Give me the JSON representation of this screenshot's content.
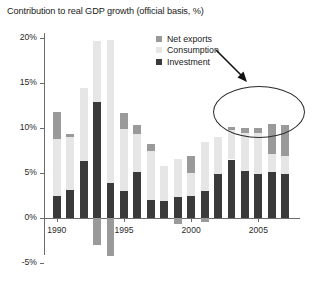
{
  "chart_data": {
    "type": "bar",
    "stacked": true,
    "title": "Contribution to real GDP growth (official basis, %)",
    "xlabel": "",
    "ylabel": "",
    "ylim": [
      -5,
      20
    ],
    "yticks": [
      "-5%",
      "0%",
      "5%",
      "10%",
      "15%",
      "20%"
    ],
    "ytick_values": [
      -5,
      0,
      5,
      10,
      15,
      20
    ],
    "xtick_labels": [
      "1990",
      "1995",
      "2000",
      "2005"
    ],
    "xtick_years": [
      1990,
      1995,
      2000,
      2005
    ],
    "grid": false,
    "legend_position": "top-center",
    "categories": [
      1990,
      1991,
      1992,
      1993,
      1994,
      1995,
      1996,
      1997,
      1998,
      1999,
      2000,
      2001,
      2002,
      2003,
      2004,
      2005,
      2006,
      2007
    ],
    "series": [
      {
        "name": "Investment",
        "color": "#3a3a3a",
        "values": [
          2.4,
          3.1,
          6.3,
          12.9,
          3.9,
          3.0,
          5.1,
          2.0,
          1.9,
          2.3,
          2.5,
          3.0,
          4.9,
          6.5,
          5.2,
          4.9,
          5.1,
          4.9
        ]
      },
      {
        "name": "Consumption",
        "color": "#e6e6e6",
        "values": [
          6.4,
          5.9,
          8.2,
          6.8,
          15.9,
          6.9,
          4.2,
          5.4,
          3.9,
          4.3,
          2.5,
          5.4,
          4.1,
          3.3,
          4.2,
          4.5,
          2.0,
          2.0
        ]
      },
      {
        "name": "Net exports",
        "color": "#9a9a9a",
        "values": [
          3.0,
          0.3,
          0.0,
          -3.0,
          -4.2,
          1.8,
          1.0,
          0.8,
          0.0,
          -0.7,
          1.9,
          -0.4,
          0.0,
          0.3,
          0.6,
          0.6,
          3.4,
          3.4
        ]
      }
    ],
    "annotations": [
      {
        "type": "ellipse",
        "note": "highlights final four years with large net exports contribution"
      },
      {
        "type": "arrow",
        "note": "arrow pointing down-right to the highlighted ellipse"
      }
    ]
  }
}
